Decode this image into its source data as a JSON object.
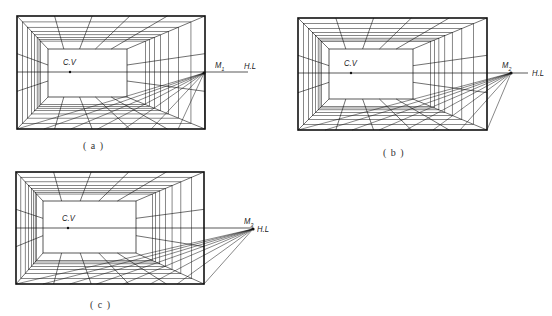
{
  "figure": {
    "panels": [
      {
        "id": "a",
        "caption": "( a )",
        "caption_pos": [
          83,
          140
        ],
        "outer": [
          17,
          16,
          205,
          129
        ],
        "inner": [
          48,
          49,
          127,
          97
        ],
        "cv": [
          70,
          72
        ],
        "cv_label": "C.V",
        "cv_label_pos": [
          63,
          57
        ],
        "m_point": [
          204,
          73
        ],
        "m_label": "M",
        "m_sub": "1",
        "m_label_pos": [
          215,
          60
        ],
        "hl_end": 248,
        "hl_label": "H.L",
        "hl_label_pos": [
          244,
          61
        ],
        "hl_start": 17
      },
      {
        "id": "b",
        "caption": "( b )",
        "caption_pos": [
          383,
          147
        ],
        "outer": [
          298,
          18,
          487,
          130
        ],
        "inner": [
          329,
          49,
          413,
          99
        ],
        "cv": [
          351,
          73
        ],
        "cv_label": "C.V",
        "cv_label_pos": [
          344,
          58
        ],
        "m_point": [
          511,
          73
        ],
        "m_label": "M",
        "m_sub": "2",
        "m_label_pos": [
          502,
          60
        ],
        "hl_end": 528,
        "hl_label": "H.L",
        "hl_label_pos": [
          532,
          68
        ],
        "hl_start": 298
      },
      {
        "id": "c",
        "caption": "( c )",
        "caption_pos": [
          90,
          299
        ],
        "outer": [
          16,
          172,
          204,
          284
        ],
        "inner": [
          43,
          201,
          136,
          253
        ],
        "cv": [
          68,
          228
        ],
        "cv_label": "C.V",
        "cv_label_pos": [
          62,
          213
        ],
        "m_point": [
          253,
          229
        ],
        "m_label": "M",
        "m_sub": "3",
        "m_label_pos": [
          244,
          216
        ],
        "hl_end": 253,
        "hl_label": "H.L",
        "hl_label_pos": [
          257,
          224
        ],
        "hl_start": 16
      }
    ],
    "line_color": "#111111",
    "background": "#ffffff"
  }
}
